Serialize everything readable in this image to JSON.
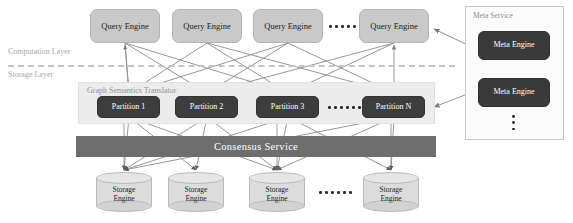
{
  "diagram": {
    "colors": {
      "query_engine_fill": "#c9c9c9",
      "partition_fill": "#3d3d3d",
      "meta_engine_fill": "#3a3a3a",
      "consensus_fill": "#6e6e6e",
      "panel_fill": "#ececec",
      "meta_panel_fill": "#fbfbfb",
      "edge_stroke": "#8c8c8c",
      "divider_stroke": "#c4c4c4",
      "storage_cylinder_fill": "#dcdcdc",
      "layer_label_color": "#a8a8a8"
    }
  },
  "layers": {
    "computation_label": "Computation Layer",
    "storage_label": "Storage Layer"
  },
  "query_engines": [
    {
      "label": "Query Engine"
    },
    {
      "label": "Query Engine"
    },
    {
      "label": "Query Engine"
    },
    {
      "label": "Query Engine"
    }
  ],
  "query_engine_ellipsis": "· · · · · ·",
  "graph_semantics": {
    "title": "Graph Semantics Translator",
    "partitions": [
      {
        "label": "Partition 1"
      },
      {
        "label": "Partition 2"
      },
      {
        "label": "Partition 3"
      },
      {
        "label": "Partition N"
      }
    ],
    "partition_ellipsis": "· · · · · ·"
  },
  "consensus": {
    "label": "Consensus Service"
  },
  "storage_engines": [
    {
      "line1": "Storage",
      "line2": "Engine"
    },
    {
      "line1": "Storage",
      "line2": "Engine"
    },
    {
      "line1": "Storage",
      "line2": "Engine"
    },
    {
      "line1": "Storage",
      "line2": "Engine"
    }
  ],
  "storage_engine_ellipsis": "· · · · · ·",
  "meta_service": {
    "title": "Meta Service",
    "engines": [
      {
        "label": "Meta Engine"
      },
      {
        "label": "Meta Engine"
      }
    ],
    "vertical_ellipsis": "⋮"
  }
}
